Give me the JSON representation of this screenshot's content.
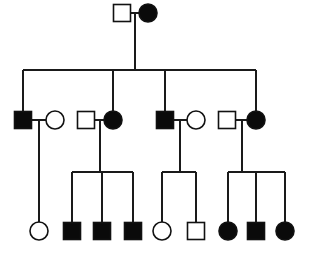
{
  "figure": {
    "type": "pedigree",
    "background_color": "#ffffff",
    "line_color": "#1a1a1a",
    "affected_fill": "#0a0a0a",
    "unaffected_fill": "#ffffff",
    "symbol_legend": {
      "square": "male",
      "circle": "female",
      "filled": "affected",
      "open": "unaffected"
    },
    "generation_count": 3
  },
  "chart_data": {
    "type": "diagram",
    "generations": [
      {
        "id": "I",
        "label": "I",
        "y": 13,
        "individuals": [
          {
            "id": "I-1",
            "shape": "square",
            "sex": "male",
            "status": "unaffected",
            "x": 122,
            "y": 13
          },
          {
            "id": "I-2",
            "shape": "circle",
            "sex": "female",
            "status": "affected",
            "x": 148,
            "y": 13
          }
        ]
      },
      {
        "id": "II",
        "label": "II",
        "y": 120,
        "individuals": [
          {
            "id": "II-1",
            "shape": "square",
            "sex": "male",
            "status": "affected",
            "x": 23,
            "y": 120
          },
          {
            "id": "II-2",
            "shape": "circle",
            "sex": "female",
            "status": "unaffected",
            "x": 55,
            "y": 120
          },
          {
            "id": "II-3",
            "shape": "square",
            "sex": "male",
            "status": "unaffected",
            "x": 86,
            "y": 120
          },
          {
            "id": "II-4",
            "shape": "circle",
            "sex": "female",
            "status": "affected",
            "x": 113,
            "y": 120
          },
          {
            "id": "II-5",
            "shape": "square",
            "sex": "male",
            "status": "affected",
            "x": 165,
            "y": 120
          },
          {
            "id": "II-6",
            "shape": "circle",
            "sex": "female",
            "status": "unaffected",
            "x": 196,
            "y": 120
          },
          {
            "id": "II-7",
            "shape": "square",
            "sex": "male",
            "status": "unaffected",
            "x": 227,
            "y": 120
          },
          {
            "id": "II-8",
            "shape": "circle",
            "sex": "female",
            "status": "affected",
            "x": 256,
            "y": 120
          }
        ]
      },
      {
        "id": "III",
        "label": "III",
        "y": 231,
        "individuals": [
          {
            "id": "III-1",
            "shape": "circle",
            "sex": "female",
            "status": "unaffected",
            "x": 39,
            "y": 231
          },
          {
            "id": "III-2",
            "shape": "square",
            "sex": "male",
            "status": "affected",
            "x": 72,
            "y": 231
          },
          {
            "id": "III-3",
            "shape": "square",
            "sex": "male",
            "status": "affected",
            "x": 102,
            "y": 231
          },
          {
            "id": "III-4",
            "shape": "square",
            "sex": "male",
            "status": "affected",
            "x": 133,
            "y": 231
          },
          {
            "id": "III-5",
            "shape": "circle",
            "sex": "female",
            "status": "unaffected",
            "x": 162,
            "y": 231
          },
          {
            "id": "III-6",
            "shape": "square",
            "sex": "male",
            "status": "unaffected",
            "x": 196,
            "y": 231
          },
          {
            "id": "III-7",
            "shape": "circle",
            "sex": "female",
            "status": "affected",
            "x": 228,
            "y": 231
          },
          {
            "id": "III-8",
            "shape": "square",
            "sex": "male",
            "status": "affected",
            "x": 256,
            "y": 231
          },
          {
            "id": "III-9",
            "shape": "circle",
            "sex": "female",
            "status": "affected",
            "x": 285,
            "y": 231
          }
        ]
      }
    ],
    "matings": [
      {
        "id": "M1",
        "partners": [
          "I-1",
          "I-2"
        ],
        "children": [
          "II-1",
          "II-4",
          "II-5",
          "II-8"
        ]
      },
      {
        "id": "M2",
        "partners": [
          "II-1",
          "II-2"
        ],
        "children": [
          "III-1"
        ]
      },
      {
        "id": "M3",
        "partners": [
          "II-3",
          "II-4"
        ],
        "children": [
          "III-2",
          "III-3",
          "III-4"
        ]
      },
      {
        "id": "M4",
        "partners": [
          "II-5",
          "II-6"
        ],
        "children": [
          "III-5",
          "III-6"
        ]
      },
      {
        "id": "M5",
        "partners": [
          "II-7",
          "II-8"
        ],
        "children": [
          "III-7",
          "III-8",
          "III-9"
        ]
      }
    ],
    "counts": {
      "total_individuals": 19,
      "affected": 11,
      "unaffected": 8,
      "males": 10,
      "females": 9
    },
    "geometry": {
      "square_size": 17,
      "circle_radius": 9,
      "gen1_sibship_y": 70,
      "gen1_sibship_x1": 23,
      "gen1_sibship_x2": 256,
      "gen2_sibship_y": 172,
      "symbol_stroke_width": 1.6,
      "connector_stroke_width": 1.2
    }
  }
}
